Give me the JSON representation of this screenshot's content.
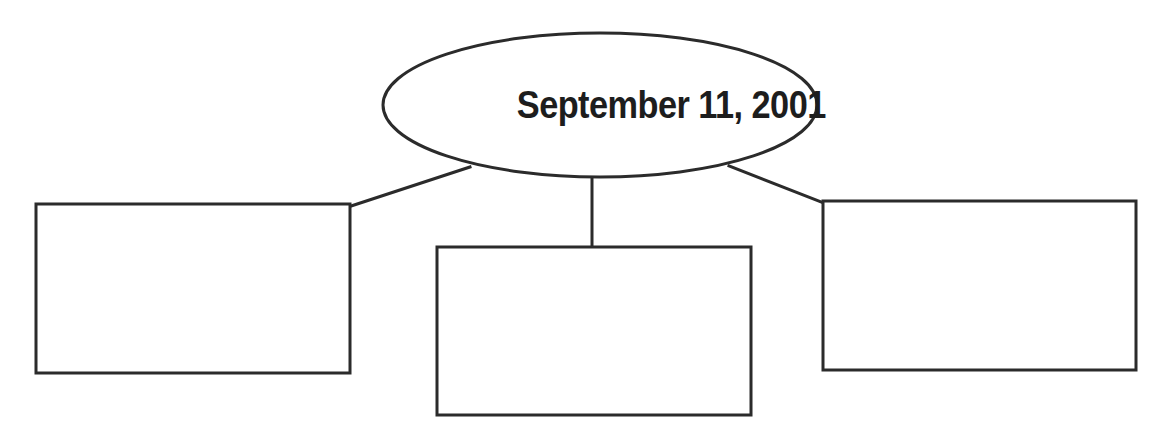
{
  "page": {
    "type": "graphic-organizer",
    "layout": "central-ellipse-with-three-boxes",
    "background_color": "#ffffff",
    "ink_color": "#2b2b2b",
    "text_color": "#1d1d1d"
  },
  "center_node": {
    "shape": "ellipse",
    "label": "September 11, 2001",
    "cx": 600,
    "cy": 105,
    "rx": 217,
    "ry": 72,
    "stroke_width": 3
  },
  "boxes": [
    {
      "id": "left-box",
      "label": "",
      "x": 36,
      "y": 204,
      "width": 314,
      "height": 169,
      "stroke_width": 3
    },
    {
      "id": "center-box",
      "label": "",
      "x": 437,
      "y": 247,
      "width": 314,
      "height": 168,
      "stroke_width": 3
    },
    {
      "id": "right-box",
      "label": "",
      "x": 823,
      "y": 201,
      "width": 313,
      "height": 169,
      "stroke_width": 3
    }
  ],
  "connectors": [
    {
      "id": "connector-left",
      "from": "center_node",
      "to": "left-box",
      "x1": 470,
      "y1": 167,
      "x2": 351,
      "y2": 206,
      "stroke_width": 3
    },
    {
      "id": "connector-center",
      "from": "center_node",
      "to": "center-box",
      "x1": 592,
      "y1": 177,
      "x2": 592,
      "y2": 248,
      "stroke_width": 3
    },
    {
      "id": "connector-right",
      "from": "center_node",
      "to": "right-box",
      "x1": 729,
      "y1": 166,
      "x2": 824,
      "y2": 203,
      "stroke_width": 3
    }
  ]
}
